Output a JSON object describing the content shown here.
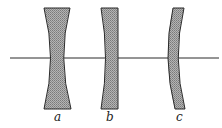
{
  "figure": {
    "colors": {
      "background": "#ffffff",
      "stroke": "#2a2a2a",
      "fill": "#9a9a9a"
    },
    "lenses": [
      {
        "id": "a",
        "label": "a",
        "type": "biconcave"
      },
      {
        "id": "b",
        "label": "b",
        "type": "plano-concave"
      },
      {
        "id": "c",
        "label": "c",
        "type": "concavo-convex"
      }
    ]
  }
}
